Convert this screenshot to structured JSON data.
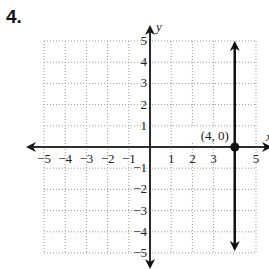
{
  "problem": {
    "number": "4."
  },
  "chart_data": {
    "type": "line",
    "title": "",
    "xlabel": "x",
    "ylabel": "y",
    "xlim": [
      -5,
      5
    ],
    "ylim": [
      -5,
      5
    ],
    "grid": true,
    "grid_style": "dotted",
    "x_ticks": [
      -5,
      -4,
      -3,
      -2,
      -1,
      1,
      2,
      3,
      5
    ],
    "x_tick_labels": [
      "−5",
      "−4",
      "−3",
      "−2",
      "−1",
      "1",
      "2",
      "3",
      "5"
    ],
    "y_ticks": [
      -5,
      -4,
      -3,
      -2,
      -1,
      1,
      2,
      3,
      4,
      5
    ],
    "y_tick_labels": [
      "−5",
      "−4",
      "−3",
      "−2",
      "−1",
      "1",
      "2",
      "3",
      "4",
      "5"
    ],
    "series": [
      {
        "name": "x = 4",
        "kind": "vertical-line",
        "x": 4,
        "y_range": [
          -5,
          5
        ],
        "arrows": "both",
        "color": "#111111"
      }
    ],
    "points": [
      {
        "x": 4,
        "y": 0,
        "label": "(4, 0)",
        "filled": true
      }
    ],
    "colors": {
      "line": "#111111",
      "grid": "#9a9a9a",
      "axis": "#222222"
    }
  }
}
